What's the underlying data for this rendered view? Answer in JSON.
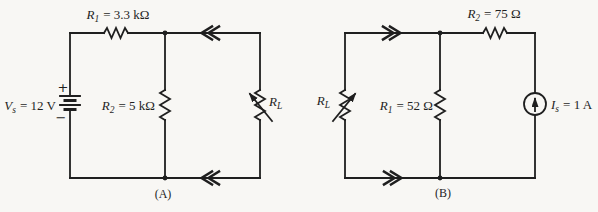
{
  "figure": {
    "colors": {
      "background": "#f8f7f4",
      "ink": "#1f1f1f"
    },
    "battery_polarity": {
      "plus": "+",
      "minus": "−"
    },
    "circuits": [
      {
        "caption": "(A)",
        "source_label": {
          "name": "V",
          "sub": "s",
          "eq": "= 12 V"
        },
        "r1_label": {
          "name": "R",
          "sub": "1",
          "eq": "= 3.3 kΩ"
        },
        "r2_label": {
          "name": "R",
          "sub": "2",
          "eq": "= 5 kΩ"
        },
        "load_label": {
          "name": "R",
          "sub": "L",
          "eq": ""
        }
      },
      {
        "caption": "(B)",
        "load_label": {
          "name": "R",
          "sub": "L",
          "eq": ""
        },
        "r1_label": {
          "name": "R",
          "sub": "1",
          "eq": "= 52 Ω"
        },
        "r2_label": {
          "name": "R",
          "sub": "2",
          "eq": "= 75 Ω"
        },
        "source_label": {
          "name": "I",
          "sub": "s",
          "eq": "= 1 A"
        }
      }
    ]
  }
}
